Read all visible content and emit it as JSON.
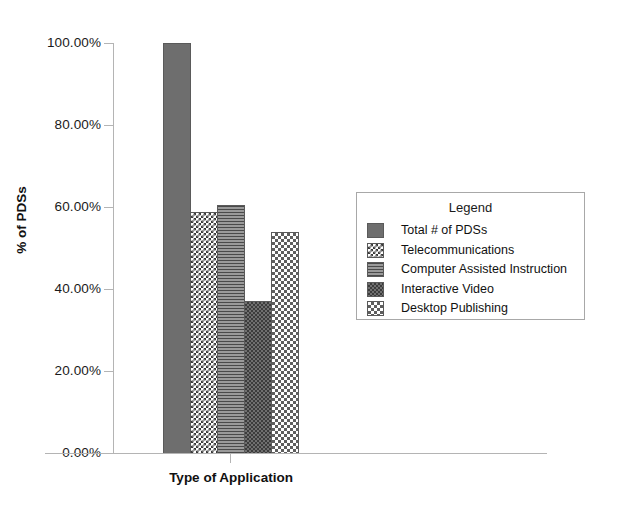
{
  "chart_data": {
    "type": "bar",
    "title": "",
    "xlabel": "Type of Application",
    "ylabel": "% of PDSs",
    "ylim": [
      0,
      100
    ],
    "ytick_labels": [
      "100.00%",
      "80.00%",
      "60.00%",
      "40.00%",
      "20.00%",
      "0.00%"
    ],
    "ytick_values": [
      100,
      80,
      60,
      40,
      20,
      0
    ],
    "grid": false,
    "legend_position": "right",
    "legend_title": "Legend",
    "categories": [
      "Type of Application"
    ],
    "series": [
      {
        "name": "Total # of PDSs",
        "values": [
          100.0
        ],
        "pattern": "solid-gray",
        "color": "#6e6e6e"
      },
      {
        "name": "Telecommunications",
        "values": [
          58.8
        ],
        "pattern": "fine-checkerboard-light",
        "color": "#3a3a3a"
      },
      {
        "name": "Computer Assisted Instruction",
        "values": [
          60.5
        ],
        "pattern": "horizontal-lines",
        "color": "#8a8a8a"
      },
      {
        "name": "Interactive Video",
        "values": [
          37.3
        ],
        "pattern": "fine-checkerboard-dark",
        "color": "#6f6f6f"
      },
      {
        "name": "Desktop Publishing",
        "values": [
          53.9
        ],
        "pattern": "coarse-checkerboard-light",
        "color": "#5e5e5e"
      }
    ]
  },
  "axis": {
    "y_title": "% of PDSs",
    "x_title": "Type of Application",
    "ticks": [
      {
        "label": "100.00%"
      },
      {
        "label": "80.00%"
      },
      {
        "label": "60.00%"
      },
      {
        "label": "40.00%"
      },
      {
        "label": "20.00%"
      },
      {
        "label": "0.00%"
      }
    ]
  },
  "legend": {
    "title": "Legend",
    "items": [
      {
        "label": "Total # of PDSs"
      },
      {
        "label": "Telecommunications"
      },
      {
        "label": "Computer Assisted Instruction"
      },
      {
        "label": "Interactive Video"
      },
      {
        "label": "Desktop Publishing"
      }
    ]
  },
  "colors": {
    "axis_line": "#b4b4b4",
    "bar_border": "#5a5a5a",
    "legend_border": "#a8a8a8",
    "text": "#111111",
    "background": "#ffffff"
  }
}
